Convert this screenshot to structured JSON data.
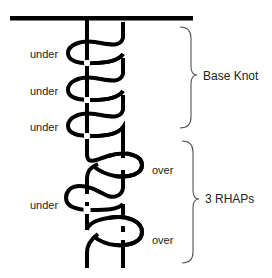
{
  "diagram": {
    "colors": {
      "strand": "#000000",
      "brace": "#555555",
      "text": "#222222",
      "background": "#ffffff"
    },
    "crossing_labels": [
      {
        "text": "under",
        "side": "left",
        "x": 30,
        "y": 48
      },
      {
        "text": "under",
        "side": "left",
        "x": 30,
        "y": 85
      },
      {
        "text": "under",
        "side": "left",
        "x": 30,
        "y": 121
      },
      {
        "text": "over",
        "side": "right",
        "x": 152,
        "y": 164
      },
      {
        "text": "under",
        "side": "left",
        "x": 30,
        "y": 199
      },
      {
        "text": "over",
        "side": "right",
        "x": 152,
        "y": 234
      }
    ],
    "groups": [
      {
        "label": "Base Knot",
        "brace_top": 27,
        "brace_bottom": 128,
        "x": 203,
        "y": 70
      },
      {
        "label": "3 RHAPs",
        "brace_top": 141,
        "brace_bottom": 263,
        "x": 205,
        "y": 193
      }
    ]
  }
}
